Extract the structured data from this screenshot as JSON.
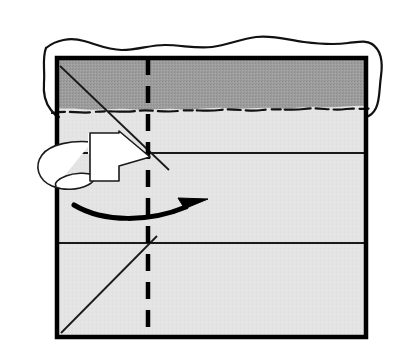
{
  "figure": {
    "type": "origami-instruction",
    "canvas": {
      "width": 405,
      "height": 361
    },
    "background_color": "#ffffff"
  },
  "paper": {
    "name": "paper-square",
    "description": "Square sheet of paper seen from the front",
    "left": 57,
    "top": 58,
    "right": 366,
    "bottom": 337,
    "face_color": "#e3e3e3",
    "border_color": "#000000",
    "border_width": 4.5
  },
  "shaded_band": {
    "name": "dark-band",
    "description": "Darker shaded strip across the top of the paper",
    "top": 58,
    "bottom": 108,
    "fill_color": "#9a9a9a",
    "texture": "halftone-dither"
  },
  "torn_edge": {
    "name": "torn-paper-edge",
    "description": "Rough torn edge outline drawn above and across the paper",
    "stroke_color": "#111111",
    "stroke_width": 2.2
  },
  "creases": {
    "vertical_center": {
      "name": "center-dashed-crease",
      "style": "dashed",
      "x": 148,
      "y_start": 58,
      "y_end": 337,
      "stroke_color": "#000000",
      "stroke_width": 4.5,
      "dash_pattern": "17 11"
    },
    "horizontals": [
      {
        "name": "upper-horizontal-crease",
        "y": 153,
        "x_start": 57,
        "x_end": 366
      },
      {
        "name": "lower-horizontal-crease",
        "y": 243,
        "x_start": 57,
        "x_end": 366
      }
    ],
    "diagonals": [
      {
        "name": "upper-diagonal-crease",
        "x1": 60,
        "y1": 66,
        "x2": 169,
        "y2": 170
      },
      {
        "name": "lower-diagonal-crease",
        "x1": 61,
        "y1": 333,
        "x2": 157,
        "y2": 236
      }
    ],
    "thin_stroke_color": "#1a1a1a",
    "thin_stroke_width": 1.8
  },
  "turn_over_arrow": {
    "name": "turn-over-arrow",
    "description": "White block arrow with looping tail that wraps behind the left edge, meaning turn the paper over",
    "fill_color": "#ffffff",
    "stroke_color": "#1a1a1a",
    "stroke_width": 1.6,
    "points_toward": "right",
    "tip_x": 150,
    "tip_y": 157
  },
  "fold_arrow": {
    "name": "fold-direction-arrow",
    "description": "Thin curved black arrow sweeping to the right",
    "stroke_color": "#000000",
    "stroke_width": 5,
    "start_x": 74,
    "start_y": 205,
    "end_x": 204,
    "end_y": 206,
    "points_toward": "right"
  },
  "legend": {
    "step_label": "",
    "notes": ""
  }
}
